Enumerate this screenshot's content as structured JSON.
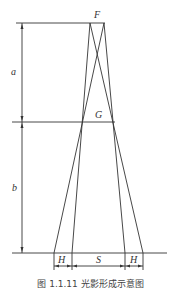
{
  "diagram": {
    "labels": {
      "top_point": "F",
      "middle_point": "G",
      "upper_distance": "a",
      "lower_distance": "b",
      "left_width": "H",
      "center_width": "S",
      "right_width": "H"
    },
    "caption": "图 1.1.11   光影形成示意图",
    "colors": {
      "line": "#333333",
      "text": "#333333",
      "background": "#ffffff"
    }
  }
}
